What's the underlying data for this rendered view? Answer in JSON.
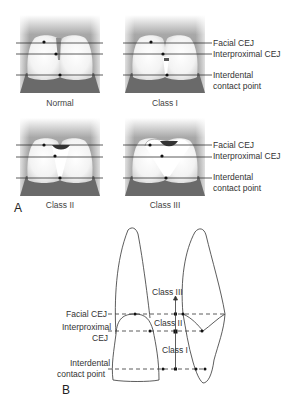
{
  "panel_a": {
    "letter": "A",
    "captions": {
      "normal": "Normal",
      "class1": "Class I",
      "class2": "Class II",
      "class3": "Class III"
    },
    "row1_labels": {
      "facial": "Facial CEJ",
      "interproximal": "Interproximal CEJ",
      "interdental_1": "Interdental",
      "interdental_2": "contact point"
    },
    "row2_labels": {
      "facial": "Facial CEJ",
      "interproximal": "Interproximal CEJ",
      "interdental_1": "Interdental",
      "interdental_2": "contact point"
    }
  },
  "panel_b": {
    "letter": "B",
    "labels": {
      "facial": "Facial CEJ",
      "interproximal_1": "Interproximal",
      "interproximal_2": "CEJ",
      "interdental_1": "Interdental",
      "interdental_2": "contact point"
    },
    "classes": {
      "class3": "Class III",
      "class2": "Class II",
      "class1": "Class I"
    }
  },
  "colors": {
    "gingiva_bg": "#9a9a9a",
    "bone": "#6e6e6e",
    "tooth": "#f4f4f4",
    "line": "#333333",
    "papilla_dark": "#3a3a3a"
  }
}
